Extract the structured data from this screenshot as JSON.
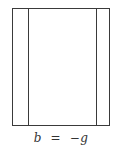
{
  "diagram": {
    "panels": [
      "left-strip",
      "center",
      "right-strip"
    ],
    "caption": {
      "lhs": "b",
      "op": "  =  ",
      "rhs_sign": "−",
      "rhs": "g"
    }
  }
}
